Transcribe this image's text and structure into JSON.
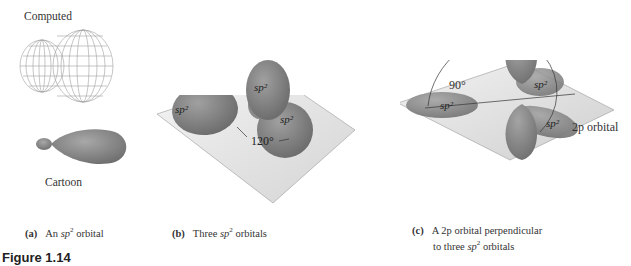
{
  "panel_a": {
    "computed_label": "Computed",
    "cartoon_label": "Cartoon",
    "caption_tag": "(a)",
    "caption_pre": "An ",
    "caption_italic": "sp",
    "caption_sup": "2",
    "caption_post": " orbital"
  },
  "panel_b": {
    "lobe_label": "sp2",
    "angle_label": "120°",
    "caption_tag": "(b)",
    "caption_pre": "Three ",
    "caption_italic": "sp",
    "caption_sup": "2",
    "caption_post": " orbitals"
  },
  "panel_c": {
    "angle_label": "90°",
    "p_orbital_label": "2p orbital",
    "lobe_label": "sp2",
    "caption_tag": "(c)",
    "caption_line1": "A 2p orbital perpendicular",
    "caption_line2_pre": "to three ",
    "caption_italic": "sp",
    "caption_sup": "2",
    "caption_post": " orbitals"
  },
  "figure_label": "Figure 1.14",
  "colors": {
    "orbital": "#8a8a8a",
    "plane": "#e6e6e6",
    "mesh": "#9a9a9a"
  }
}
